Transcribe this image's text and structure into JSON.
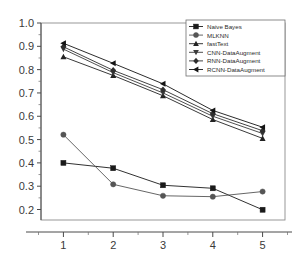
{
  "chart_data": {
    "type": "line",
    "title": "",
    "subtitle": "",
    "xlabel": "",
    "ylabel": "",
    "x": [
      1,
      2,
      3,
      4,
      5
    ],
    "categories": [
      "1",
      "2",
      "3",
      "4",
      "5"
    ],
    "xtick_labels": [
      "1",
      "2",
      "3",
      "4",
      "5"
    ],
    "ytick_labels": [
      "0.2",
      "0.3",
      "0.4",
      "0.5",
      "0.6",
      "0.7",
      "0.8",
      "0.9",
      "1.0"
    ],
    "ytick_values": [
      0.2,
      0.3,
      0.4,
      0.5,
      0.6,
      0.7,
      0.8,
      0.9,
      1.0
    ],
    "xlim": [
      0.55,
      5.45
    ],
    "ylim": [
      0.155,
      1.0
    ],
    "grid": false,
    "legend_position": "top-right",
    "series": [
      {
        "name": "Naive Bayes",
        "marker": "square",
        "color": "#1a1a1a",
        "values": [
          0.4,
          0.377,
          0.304,
          0.291,
          0.199
        ]
      },
      {
        "name": "MLKNN",
        "marker": "circle",
        "color": "#555555",
        "values": [
          0.521,
          0.308,
          0.259,
          0.255,
          0.277
        ]
      },
      {
        "name": "fastText",
        "marker": "triangle-up",
        "color": "#222222",
        "values": [
          0.855,
          0.775,
          0.688,
          0.586,
          0.505
        ]
      },
      {
        "name": "CNN-DataAugment",
        "marker": "triangle-down",
        "color": "#3c3c3c",
        "values": [
          0.888,
          0.787,
          0.7,
          0.6,
          0.526
        ]
      },
      {
        "name": "RNN-DataAugment",
        "marker": "diamond",
        "color": "#2e2e2e",
        "values": [
          0.898,
          0.797,
          0.714,
          0.611,
          0.538
        ]
      },
      {
        "name": "RCNN-DataAugment",
        "marker": "triangle-left",
        "color": "#141414",
        "values": [
          0.913,
          0.827,
          0.739,
          0.625,
          0.553
        ]
      }
    ]
  },
  "legend": {
    "entries": [
      "Naive Bayes",
      "MLKNN",
      "fastText",
      "CNN-DataAugment",
      "RNN-DataAugment",
      "RCNN-DataAugment"
    ]
  },
  "colors": {
    "axis": "#4a4a4a",
    "frame": "#8d8d8d",
    "background": "#ffffff",
    "text": "#3a3a3a"
  }
}
